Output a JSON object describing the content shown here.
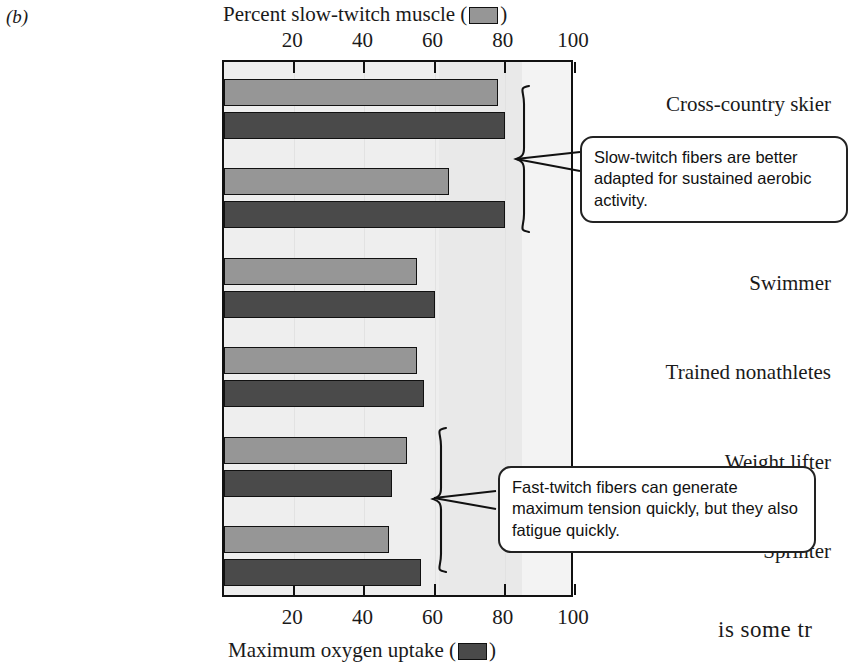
{
  "figure": {
    "panel_letter": "(b)",
    "body_text_fragment": "is some tr"
  },
  "legend": {
    "light_swatch_name": "slow-twitch-swatch",
    "dark_swatch_name": "oxygen-uptake-swatch",
    "light_color": "#969696",
    "dark_color": "#4a4a4a"
  },
  "annotations": [
    {
      "name": "callout-slow-twitch",
      "text": "Slow-twitch fibers are better adapted for sustained aerobic activity.",
      "targets": [
        "Cross-country skier",
        "Long-distance runner"
      ]
    },
    {
      "name": "callout-fast-twitch",
      "text": "Fast-twitch fibers can generate maximum tension quickly, but they also fatigue quickly.",
      "targets": [
        "Weight lifter",
        "Sprinter"
      ]
    }
  ],
  "chart_data": {
    "type": "bar",
    "orientation": "horizontal",
    "title": "",
    "top_axis_label": "Percent slow-twitch muscle",
    "bottom_axis_label": "Maximum oxygen uptake",
    "xlabel": "Maximum oxygen uptake",
    "ylabel": "",
    "xlim": [
      0,
      100
    ],
    "ticks": [
      20,
      40,
      60,
      80,
      100
    ],
    "tick_labels": [
      "20",
      "40",
      "60",
      "80",
      "100"
    ],
    "grid": false,
    "legend_position": "axis-titles",
    "categories": [
      "Cross-country skier",
      "Long-distance runner",
      "Swimmer",
      "Trained nonathletes",
      "Weight lifter",
      "Sprinter"
    ],
    "series": [
      {
        "name": "Percent slow-twitch muscle",
        "color": "#969696",
        "values": [
          78,
          64,
          55,
          55,
          52,
          47
        ]
      },
      {
        "name": "Maximum oxygen uptake",
        "color": "#4a4a4a",
        "values": [
          80,
          80,
          60,
          57,
          48,
          56
        ]
      }
    ]
  }
}
